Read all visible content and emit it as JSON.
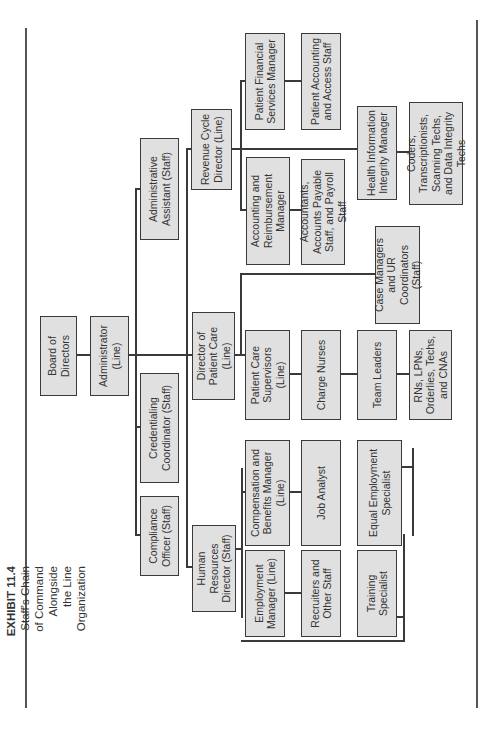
{
  "caption": {
    "exhibit": "EXHIBIT 11.4",
    "title_lines": [
      "Staff's Chain",
      "of Command",
      "Alongside",
      "the Line",
      "Organization"
    ]
  },
  "nodes": {
    "board": "Board of Directors",
    "administrator": "Administrator (Line)",
    "admin_assistant": "Administrative Assistant (Staff)",
    "credentialing": "Credentialing Coordinator (Staff)",
    "compliance": "Compliance Officer (Staff)",
    "revenue_cycle": "Revenue Cycle Director (Line)",
    "director_patient_care": "Director of Patient Care (Line)",
    "hr_director": "Human Resources Director (Staff)",
    "patient_financial": "Patient Financial Services Manager",
    "patient_accounting": "Patient Accounting and Access Staff",
    "accounting_reimbursement": "Accounting and Reimbursement Manager",
    "accountants": "Accountants, Accounts Payable Staff, and Payroll Staff",
    "him_manager": "Health Information Integrity Manager",
    "coders": "Coders, Transcriptionists, Scanning Techs, and Data Integrity Techs",
    "case_managers": "Case Managers and UR Coordinators (Staff)",
    "patient_care_supervisors": "Patient Care Supervisors (Line)",
    "charge_nurses": "Charge Nurses",
    "team_leaders": "Team Leaders",
    "rns": "RNs, LPNs, Orderlies, Techs, and CNAs",
    "comp_benefits": "Compensation and Benefits Manager (Line)",
    "job_analyst": "Job Analyst",
    "eeo": "Equal Employment Specialist",
    "employment_manager": "Employment Manager (Line)",
    "recruiters": "Recruiters and Other Staff",
    "training": "Training Specialist"
  },
  "colors": {
    "box_fill": "#e0e0e0",
    "box_border": "#3a3a3a",
    "line": "#3a3a3a"
  }
}
